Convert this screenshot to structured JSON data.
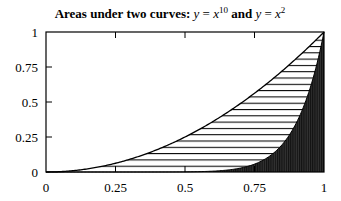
{
  "chart_data": {
    "type": "area",
    "title_parts": {
      "prefix": "Areas under two curves: ",
      "eq1_lhs": "y",
      "eq1_eq": " = ",
      "eq1_base": "x",
      "eq1_exp": "10",
      "conj": " and ",
      "eq2_lhs": "y",
      "eq2_eq": " = ",
      "eq2_base": "x",
      "eq2_exp": "2"
    },
    "xlabel": "",
    "ylabel": "",
    "xlim": [
      0,
      1
    ],
    "ylim": [
      0,
      1
    ],
    "xticks": [
      "0",
      "0.25",
      "0.5",
      "0.75",
      "1"
    ],
    "yticks": [
      "0",
      "0.25",
      "0.5",
      "0.75",
      "1"
    ],
    "grid": false,
    "series": [
      {
        "name": "y = x^2",
        "function": "x^2",
        "fill": "horizontal hatch",
        "color": "#000000",
        "x": [
          0,
          0.25,
          0.5,
          0.75,
          1
        ],
        "values": [
          0,
          0.0625,
          0.25,
          0.5625,
          1
        ]
      },
      {
        "name": "y = x^10",
        "function": "x^10",
        "fill": "dense vertical hatch (dark)",
        "color": "#000000",
        "x": [
          0,
          0.25,
          0.5,
          0.75,
          1
        ],
        "values": [
          0,
          9.5e-07,
          0.00098,
          0.0563,
          1
        ]
      }
    ]
  }
}
